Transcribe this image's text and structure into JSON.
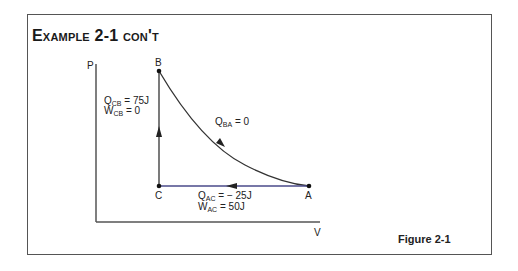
{
  "title": "Example 2-1 con't",
  "figure_caption": "Figure 2-1",
  "axes": {
    "y_label": "P",
    "x_label": "V"
  },
  "points": {
    "A": {
      "label": "A"
    },
    "B": {
      "label": "B"
    },
    "C": {
      "label": "C"
    }
  },
  "processes": {
    "CB": {
      "q_sym": "Q",
      "q_sub": "CB",
      "q_val": "= 75J",
      "w_sym": "W",
      "w_sub": "CB",
      "w_val": "= 0"
    },
    "BA": {
      "q_sym": "Q",
      "q_sub": "BA",
      "q_val": "= 0"
    },
    "AC": {
      "q_sym": "Q",
      "q_sub": "AC",
      "q_val": "= − 25J",
      "w_sym": "W",
      "w_sub": "AC",
      "w_val": "= 50J"
    }
  },
  "colors": {
    "line": "#333333",
    "ac_line": "#4a4a8a",
    "frame": "#555555"
  }
}
